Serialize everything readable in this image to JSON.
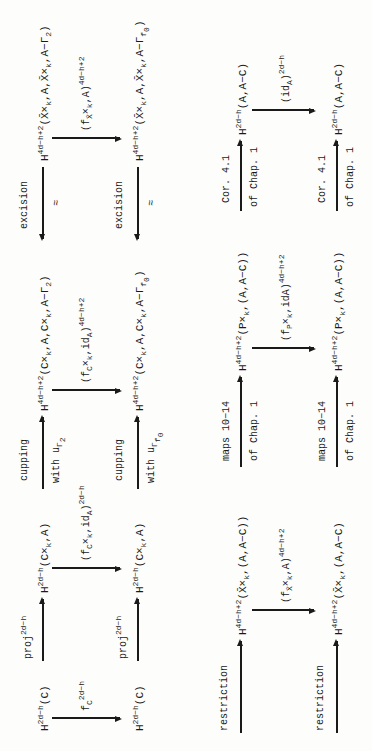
{
  "diagram": {
    "top": {
      "row1": {
        "n1": "H^{2d-h}(C)",
        "n2": "H^{2d-h}(C×_k,A)",
        "n3": "H^{4d-h+2}(C×_k,A,C×_k,A−Γ_2)",
        "n4": "H^{4d-h+2}(X̄×_k,A,X̄×_k,A−Γ_2)",
        "e12": "proj^{2d-h}",
        "e23_top": "cupping",
        "e23_bottom": "with u_{Γ_2}",
        "e34_top": "excision",
        "e34_bottom": "≈"
      },
      "verticals": {
        "v1": "f_C^{2d-h}",
        "v2": "(f_{C}×_k, id_A)^{2d-h}",
        "v3": "(f_{C}×_k, id_A)^{4d-h+2}",
        "v4": "(f_{X̄}×_k, A)^{4d-h+2}"
      },
      "row2": {
        "n1": "H^{2d-h}(C)",
        "n2": "H^{2d-h}(C×_k,A)",
        "n3": "H^{4d-h+2}(C×_k,A,C×_k,A−Γ_{f_0})",
        "n4": "H^{4d-h+2}(X̄×_k,A,X̄×_k,A−Γ_{f_0})",
        "e12": "proj^{2d-h}",
        "e23_top": "cupping",
        "e23_bottom": "with u_{Γ_{f_0}}",
        "e34_top": "excision",
        "e34_bottom": "≈"
      }
    },
    "bottom": {
      "row1": {
        "n1": "H^{4d-h+2}(X̄×_k,(A,A−C))",
        "n2": "H^{4d-h+2}(P×_k,(A,A−C))",
        "n3": "H^{2d-h}(A,A−C)",
        "e01": "restriction",
        "e12_top": "maps 10-14",
        "e12_bottom": "of Chap. 1",
        "e23_top": "Cor. 4.1",
        "e23_bottom": "of Chap. 1"
      },
      "verticals": {
        "v1": "(f_{X̄}×_k, A)^{4d-h+2}",
        "v2": "(f_P×_k, idA)^{4d-h+2}",
        "v3": "(id_A)^{2d-h}"
      },
      "row2": {
        "n1": "H^{4d-h+2}(X̄×_k,(A,A−C))",
        "n2": "H^{4d-h+2}(P×_k,(A,A−C))",
        "n3": "H^{2d-h}(A,A−C)",
        "e01": "restriction",
        "e12_top": "maps 10-14",
        "e12_bottom": "of Chap. 1",
        "e23_top": "Cor. 4.1",
        "e23_bottom": "of Chap. 1"
      }
    }
  }
}
